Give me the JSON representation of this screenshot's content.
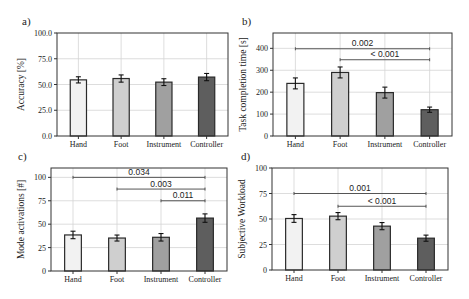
{
  "colors": {
    "Hand": "#f2f2f2",
    "Foot": "#cfcfcf",
    "Instrument": "#a0a0a0",
    "Controller": "#5e5e5e",
    "grid": "#d4d4d4",
    "axis": "#333333",
    "bar_edge": "#2a2a2a",
    "sig_line": "#555555"
  },
  "chart_data": [
    {
      "panel_label": "a)",
      "type": "bar",
      "title": "",
      "xlabel": "",
      "ylabel": "Accuracy [%]",
      "categories": [
        "Hand",
        "Foot",
        "Instrument",
        "Controller"
      ],
      "values": [
        54.5,
        55.8,
        52.3,
        57.2
      ],
      "errors": [
        3.0,
        3.5,
        3.3,
        3.5
      ],
      "ylim": [
        0,
        100
      ],
      "yticks": [
        0,
        25,
        50,
        75,
        100
      ],
      "ytick_labels": [
        "0.0",
        "25.0",
        "50.0",
        "75.0",
        "100.0"
      ],
      "grid": true,
      "significance": [],
      "frame": {
        "x0": 57,
        "y0": 33,
        "x1": 228,
        "y1": 136
      }
    },
    {
      "panel_label": "b)",
      "type": "bar",
      "title": "",
      "xlabel": "",
      "ylabel": "Task completion time [s]",
      "categories": [
        "Hand",
        "Foot",
        "Instrument",
        "Controller"
      ],
      "values": [
        240,
        290,
        198,
        120
      ],
      "errors": [
        25,
        25,
        25,
        12
      ],
      "ylim": [
        0,
        470
      ],
      "yticks": [
        0,
        100,
        200,
        300,
        400
      ],
      "ytick_labels": [
        "0",
        "100",
        "200",
        "300",
        "400"
      ],
      "grid": true,
      "significance": [
        {
          "from": 0,
          "to": 3,
          "y": 398,
          "label": "0.002"
        },
        {
          "from": 1,
          "to": 3,
          "y": 348,
          "label": "< 0.001"
        }
      ],
      "frame": {
        "x0": 273,
        "y0": 33,
        "x1": 452,
        "y1": 136
      }
    },
    {
      "panel_label": "c)",
      "type": "bar",
      "title": "",
      "xlabel": "",
      "ylabel": "Mode activations [#]",
      "categories": [
        "Hand",
        "Foot",
        "Instrument",
        "Controller"
      ],
      "values": [
        38.5,
        35.2,
        36.0,
        56.5
      ],
      "errors": [
        4.0,
        3.2,
        4.0,
        4.5
      ],
      "ylim": [
        0,
        110
      ],
      "yticks": [
        0,
        25,
        50,
        75,
        100
      ],
      "ytick_labels": [
        "0",
        "25",
        "50",
        "75",
        "100"
      ],
      "grid": true,
      "significance": [
        {
          "from": 0,
          "to": 3,
          "y": 100,
          "label": "0.034"
        },
        {
          "from": 1,
          "to": 3,
          "y": 87.5,
          "label": "0.003"
        },
        {
          "from": 2,
          "to": 3,
          "y": 75,
          "label": "0.011"
        }
      ],
      "frame": {
        "x0": 51,
        "y0": 168,
        "x1": 227,
        "y1": 271
      }
    },
    {
      "panel_label": "d)",
      "type": "bar",
      "title": "",
      "xlabel": "",
      "ylabel": "Subjective Workload",
      "categories": [
        "Hand",
        "Foot",
        "Instrument",
        "Controller"
      ],
      "values": [
        50.5,
        52.8,
        43.0,
        31.2
      ],
      "errors": [
        3.8,
        3.5,
        3.5,
        3.0
      ],
      "ylim": [
        0,
        100
      ],
      "yticks": [
        0,
        25,
        50,
        75,
        100
      ],
      "ytick_labels": [
        "0",
        "25",
        "50",
        "75",
        "100"
      ],
      "grid": true,
      "significance": [
        {
          "from": 0,
          "to": 3,
          "y": 75,
          "label": "0.001"
        },
        {
          "from": 1,
          "to": 3,
          "y": 62.5,
          "label": "< 0.001"
        }
      ],
      "frame": {
        "x0": 272,
        "y0": 168,
        "x1": 448,
        "y1": 270
      }
    }
  ]
}
